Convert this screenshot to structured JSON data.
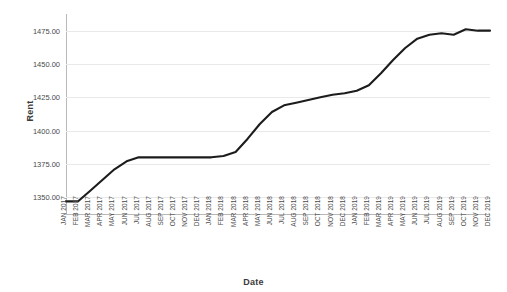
{
  "chart_data": {
    "type": "line",
    "title": "",
    "xlabel": "Date",
    "ylabel": "Rent",
    "grid": true,
    "legend": "none",
    "ylim": [
      1337.5,
      1487.5
    ],
    "yticks": [
      "1350.00",
      "1375.00",
      "1400.00",
      "1425.00",
      "1450.00",
      "1475.00"
    ],
    "ytick_values": [
      1350,
      1375,
      1400,
      1425,
      1450,
      1475
    ],
    "categories": [
      "JAN 2017",
      "FEB 2017",
      "MAR 2017",
      "APR 2017",
      "MAY 2017",
      "JUN 2017",
      "JUL 2017",
      "AUG 2017",
      "SEP 2017",
      "OCT 2017",
      "NOV 2017",
      "DEC 2017",
      "JAN 2018",
      "FEB 2018",
      "MAR 2018",
      "APR 2018",
      "MAY 2018",
      "JUN 2018",
      "JUL 2018",
      "AUG 2018",
      "SEP 2018",
      "OCT 2018",
      "NOV 2018",
      "DEC 2018",
      "JAN 2019",
      "FEB 2019",
      "MAR 2019",
      "APR 2019",
      "MAY 2019",
      "JUN 2019",
      "JUL 2019",
      "AUG 2019",
      "SEP 2019",
      "OCT 2019",
      "NOV 2019",
      "DEC 2019"
    ],
    "series": [
      {
        "name": "Rent",
        "color": "#1c1c1c",
        "values": [
          1347,
          1347,
          1355,
          1363,
          1371,
          1377,
          1380,
          1380,
          1380,
          1380,
          1380,
          1380,
          1380,
          1381,
          1384,
          1394,
          1405,
          1414,
          1419,
          1421,
          1423,
          1425,
          1427,
          1428,
          1430,
          1434,
          1443,
          1453,
          1462,
          1469,
          1472,
          1473,
          1472,
          1476,
          1475,
          1475
        ]
      }
    ]
  }
}
